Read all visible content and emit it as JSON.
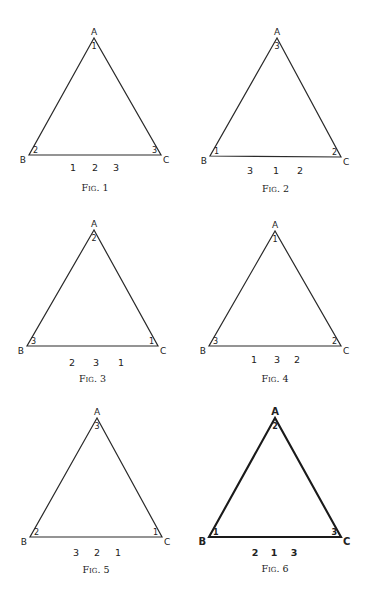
{
  "figures": [
    {
      "caption": "Fig. 1",
      "vertices": {
        "A": "A",
        "B": "B",
        "C": "C"
      },
      "angle_numbers": {
        "A": "1",
        "B": "2",
        "C": "3"
      },
      "sequence": [
        "1",
        "2",
        "3"
      ],
      "apex": [
        94,
        38
      ],
      "left": [
        29,
        155
      ],
      "right": [
        161,
        155
      ],
      "seq_y": 171,
      "seq_x": [
        73,
        95,
        116
      ],
      "caption_y": 191,
      "bold": false
    },
    {
      "caption": "Fig. 2",
      "vertices": {
        "A": "A",
        "B": "B",
        "C": "C"
      },
      "angle_numbers": {
        "A": "3",
        "B": "1",
        "C": "2"
      },
      "sequence": [
        "3",
        "1",
        "2"
      ],
      "apex": [
        277,
        38
      ],
      "left": [
        210,
        156
      ],
      "right": [
        341,
        157
      ],
      "seq_y": 174,
      "seq_x": [
        250,
        276,
        300
      ],
      "caption_y": 192,
      "bold": false
    },
    {
      "caption": "Fig. 3",
      "vertices": {
        "A": "A",
        "B": "B",
        "C": "C"
      },
      "angle_numbers": {
        "A": "2",
        "B": "3",
        "C": "1"
      },
      "sequence": [
        "2",
        "3",
        "1"
      ],
      "apex": [
        94,
        230
      ],
      "left": [
        27,
        346
      ],
      "right": [
        158,
        346
      ],
      "seq_y": 366,
      "seq_x": [
        72,
        96,
        121
      ],
      "caption_y": 382,
      "bold": false
    },
    {
      "caption": "Fig. 4",
      "vertices": {
        "A": "A",
        "B": "B",
        "C": "C"
      },
      "angle_numbers": {
        "A": "1",
        "B": "3",
        "C": "2"
      },
      "sequence": [
        "1",
        "3",
        "2"
      ],
      "apex": [
        275,
        231
      ],
      "left": [
        209,
        346
      ],
      "right": [
        341,
        346
      ],
      "seq_y": 363,
      "seq_x": [
        254,
        277,
        297
      ],
      "caption_y": 382,
      "bold": false
    },
    {
      "caption": "Fig. 5",
      "vertices": {
        "A": "A",
        "B": "B",
        "C": "C"
      },
      "angle_numbers": {
        "A": "3",
        "B": "2",
        "C": "1"
      },
      "sequence": [
        "3",
        "2",
        "1"
      ],
      "apex": [
        97,
        418
      ],
      "left": [
        30,
        537
      ],
      "right": [
        162,
        537
      ],
      "seq_y": 556,
      "seq_x": [
        76,
        97,
        118
      ],
      "caption_y": 573,
      "bold": false
    },
    {
      "caption": "Fig. 6",
      "vertices": {
        "A": "A",
        "B": "B",
        "C": "C"
      },
      "angle_numbers": {
        "A": "2",
        "B": "1",
        "C": "3"
      },
      "sequence": [
        "2",
        "1",
        "3"
      ],
      "apex": [
        275,
        418
      ],
      "left": [
        209,
        537
      ],
      "right": [
        341,
        537
      ],
      "seq_y": 556,
      "seq_x": [
        255,
        274,
        294
      ],
      "caption_y": 572,
      "bold": true
    }
  ]
}
